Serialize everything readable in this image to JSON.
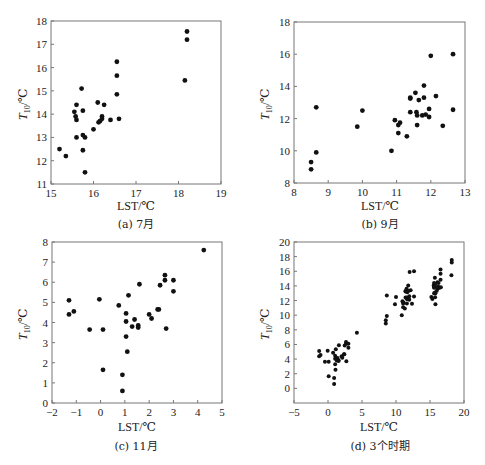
{
  "figure": {
    "panels": [
      {
        "id": "a",
        "caption": "(a) 7月",
        "xlabel": "LST/℃",
        "ylabel_main": "T",
        "ylabel_sub": "10",
        "ylabel_unit": "/℃"
      },
      {
        "id": "b",
        "caption": "(b) 9月",
        "xlabel": "LST/℃",
        "ylabel_main": "T",
        "ylabel_sub": "10",
        "ylabel_unit": "/℃"
      },
      {
        "id": "c",
        "caption": "(c) 11月",
        "xlabel": "LST/℃",
        "ylabel_main": "T",
        "ylabel_sub": "10",
        "ylabel_unit": "/℃"
      },
      {
        "id": "d",
        "caption": "(d) 3个时期",
        "xlabel": "LST/℃",
        "ylabel_main": "T",
        "ylabel_sub": "10",
        "ylabel_unit": "/℃"
      }
    ]
  },
  "chart_data": [
    {
      "type": "scatter",
      "title": "(a) 7月",
      "xlabel": "LST/℃",
      "ylabel": "T10/℃",
      "xlim": [
        15,
        19
      ],
      "ylim": [
        11,
        18
      ],
      "xticks": [
        15,
        16,
        17,
        18,
        19
      ],
      "yticks": [
        11,
        12,
        13,
        14,
        15,
        16,
        17,
        18
      ],
      "grid": false,
      "x": [
        15.2,
        15.35,
        15.55,
        15.58,
        15.6,
        15.6,
        15.6,
        15.72,
        15.75,
        15.75,
        15.75,
        15.8,
        15.8,
        16.0,
        16.1,
        16.12,
        16.15,
        16.2,
        16.2,
        16.25,
        16.4,
        16.55,
        16.55,
        16.55,
        16.6,
        18.15,
        18.2,
        18.2
      ],
      "y": [
        12.5,
        12.2,
        14.1,
        13.9,
        14.4,
        13.75,
        13.0,
        15.1,
        14.15,
        13.1,
        12.45,
        13.0,
        11.5,
        13.35,
        14.5,
        13.65,
        13.7,
        13.9,
        13.8,
        14.4,
        13.75,
        16.25,
        15.65,
        14.85,
        13.8,
        15.45,
        17.55,
        17.2
      ]
    },
    {
      "type": "scatter",
      "title": "(b) 9月",
      "xlabel": "LST/℃",
      "ylabel": "T10/℃",
      "xlim": [
        8,
        13
      ],
      "ylim": [
        8,
        18
      ],
      "xticks": [
        8,
        9,
        10,
        11,
        12,
        13
      ],
      "yticks": [
        8,
        10,
        12,
        14,
        16,
        18
      ],
      "grid": false,
      "x": [
        8.5,
        8.5,
        8.65,
        8.65,
        9.85,
        10.0,
        10.85,
        10.95,
        11.05,
        11.05,
        11.1,
        11.3,
        11.4,
        11.4,
        11.4,
        11.55,
        11.58,
        11.6,
        11.6,
        11.65,
        11.8,
        11.8,
        11.75,
        11.85,
        11.95,
        11.95,
        12.0,
        12.15,
        12.35,
        12.65,
        12.65
      ],
      "y": [
        9.3,
        8.85,
        12.7,
        9.9,
        11.5,
        12.5,
        10.0,
        11.9,
        11.6,
        11.1,
        11.75,
        10.9,
        13.3,
        13.25,
        12.4,
        13.6,
        12.4,
        12.2,
        11.6,
        13.15,
        14.05,
        13.3,
        12.2,
        12.25,
        12.6,
        12.1,
        15.9,
        13.4,
        11.55,
        16.0,
        12.55
      ]
    },
    {
      "type": "scatter",
      "title": "(c) 11月",
      "xlabel": "LST/℃",
      "ylabel": "T10/℃",
      "xlim": [
        -2,
        5
      ],
      "ylim": [
        0,
        8
      ],
      "xticks": [
        -2,
        -1,
        0,
        1,
        2,
        3,
        4,
        5
      ],
      "yticks": [
        0,
        1,
        2,
        3,
        4,
        5,
        6,
        7,
        8
      ],
      "grid": false,
      "x": [
        -1.3,
        -1.3,
        -1.1,
        -0.45,
        -0.05,
        0.1,
        0.1,
        0.75,
        0.9,
        0.9,
        1.05,
        1.05,
        1.05,
        1.1,
        1.15,
        1.3,
        1.4,
        1.55,
        1.55,
        1.6,
        2.0,
        2.1,
        2.35,
        2.4,
        2.45,
        2.65,
        2.65,
        2.7,
        3.0,
        3.0,
        4.25
      ],
      "y": [
        5.1,
        4.4,
        4.55,
        3.65,
        5.15,
        3.65,
        1.65,
        4.85,
        1.4,
        0.6,
        4.45,
        4.05,
        3.3,
        2.55,
        5.35,
        3.8,
        4.15,
        3.85,
        3.75,
        5.9,
        4.4,
        4.2,
        4.65,
        4.65,
        5.85,
        6.35,
        6.1,
        3.7,
        6.1,
        5.55,
        7.6
      ]
    },
    {
      "type": "scatter",
      "title": "(d) 3个时期",
      "xlabel": "LST/℃",
      "ylabel": "T10/℃",
      "xlim": [
        -5,
        20
      ],
      "ylim": [
        -2,
        20
      ],
      "xticks": [
        -5,
        0,
        5,
        10,
        15,
        20
      ],
      "yticks": [
        0,
        2,
        4,
        6,
        8,
        10,
        12,
        14,
        16,
        18,
        20
      ],
      "grid": false,
      "note": "Combined points of panels (a), (b), (c)"
    }
  ]
}
